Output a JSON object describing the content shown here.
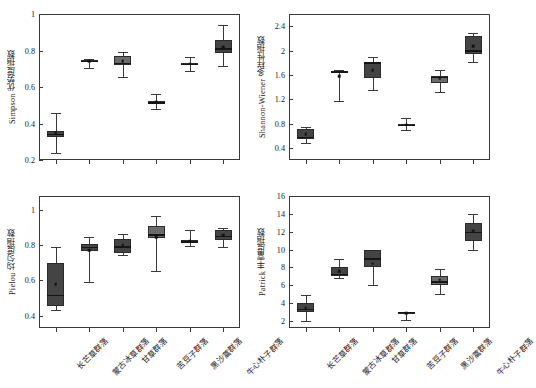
{
  "figure": {
    "categories": [
      "长芒草群落",
      "蒙古冰草群落",
      "甘草群落",
      "苦豆子群落",
      "黑沙蒿群落",
      "牛心朴子群落"
    ],
    "panels": [
      {
        "id": "simpson",
        "ylabel": "Simpson 优势度指数",
        "ylim": [
          0.2,
          1.0
        ],
        "yticks": [
          0.2,
          0.4,
          0.6,
          0.8,
          1.0
        ],
        "yticklabels": [
          "0.2",
          "0.4",
          "0.6",
          "0.8",
          "1.0"
        ]
      },
      {
        "id": "shannon",
        "ylabel": "Shannon-Wiener 多样性指数",
        "ylim": [
          0.2,
          2.6
        ],
        "yticks": [
          0.4,
          0.8,
          1.2,
          1.6,
          2.0,
          2.4
        ],
        "yticklabels": [
          "0.4",
          "0.8",
          "1.2",
          "1.6",
          "2.0",
          "2.4"
        ]
      },
      {
        "id": "pielou",
        "ylabel": "Pielou 均匀度指数",
        "ylim": [
          0.33,
          1.08
        ],
        "yticks": [
          0.4,
          0.6,
          0.8,
          1.0
        ],
        "yticklabels": [
          "0.4",
          "0.6",
          "0.8",
          "1.0"
        ]
      },
      {
        "id": "patrick",
        "ylabel": "Patrick 丰富度指数",
        "ylim": [
          1.2,
          16.0
        ],
        "yticks": [
          2,
          4,
          6,
          8,
          10,
          12,
          14,
          16
        ],
        "yticklabels": [
          "2",
          "4",
          "6",
          "8",
          "10",
          "12",
          "14",
          "16"
        ]
      }
    ]
  },
  "chart_data": [
    {
      "type": "box",
      "id": "simpson",
      "title": "",
      "xlabel": "",
      "ylabel": "Simpson 优势度指数",
      "ylim": [
        0.2,
        1.0
      ],
      "yticks": [
        0.2,
        0.4,
        0.6,
        0.8,
        1.0
      ],
      "grid": false,
      "legend": "none",
      "categories": [
        "长芒草群落",
        "蒙古冰草群落",
        "甘草群落",
        "苦豆子群落",
        "黑沙蒿群落",
        "牛心朴子群落"
      ],
      "boxes": [
        {
          "category": "长芒草群落",
          "min": 0.24,
          "q1": 0.325,
          "median": 0.345,
          "q3": 0.357,
          "max": 0.455,
          "mean": 0.347,
          "shade": "dark"
        },
        {
          "category": "蒙古冰草群落",
          "min": 0.705,
          "q1": 0.738,
          "median": 0.742,
          "q3": 0.746,
          "max": 0.753,
          "mean": 0.74,
          "shade": "dark"
        },
        {
          "category": "甘草群落",
          "min": 0.655,
          "q1": 0.718,
          "median": 0.731,
          "q3": 0.772,
          "max": 0.793,
          "mean": 0.741,
          "shade": "mid"
        },
        {
          "category": "苦豆子群落",
          "min": 0.477,
          "q1": 0.508,
          "median": 0.516,
          "q3": 0.522,
          "max": 0.562,
          "mean": 0.517,
          "shade": "dark"
        },
        {
          "category": "黑沙蒿群落",
          "min": 0.688,
          "q1": 0.723,
          "median": 0.728,
          "q3": 0.731,
          "max": 0.762,
          "mean": 0.727,
          "shade": "dark"
        },
        {
          "category": "牛心朴子群落",
          "min": 0.714,
          "q1": 0.787,
          "median": 0.811,
          "q3": 0.856,
          "max": 0.941,
          "mean": 0.817,
          "shade": "dark"
        }
      ]
    },
    {
      "type": "box",
      "id": "shannon",
      "title": "",
      "xlabel": "",
      "ylabel": "Shannon-Wiener 多样性指数",
      "ylim": [
        0.2,
        2.6
      ],
      "yticks": [
        0.4,
        0.8,
        1.2,
        1.6,
        2.0,
        2.4
      ],
      "grid": false,
      "legend": "none",
      "categories": [
        "长芒草群落",
        "蒙古冰草群落",
        "甘草群落",
        "苦豆子群落",
        "黑沙蒿群落",
        "牛心朴子群落"
      ],
      "boxes": [
        {
          "category": "长芒草群落",
          "min": 0.475,
          "q1": 0.545,
          "median": 0.585,
          "q3": 0.705,
          "max": 0.735,
          "mean": 0.627,
          "shade": "dark"
        },
        {
          "category": "蒙古冰草群落",
          "min": 1.165,
          "q1": 1.635,
          "median": 1.655,
          "q3": 1.665,
          "max": 1.675,
          "mean": 1.575,
          "shade": "dark"
        },
        {
          "category": "甘草群落",
          "min": 1.345,
          "q1": 1.545,
          "median": 1.805,
          "q3": 1.815,
          "max": 1.895,
          "mean": 1.675,
          "shade": "dark"
        },
        {
          "category": "苦豆子群落",
          "min": 0.685,
          "q1": 0.755,
          "median": 0.775,
          "q3": 0.785,
          "max": 0.885,
          "mean": 0.78,
          "shade": "mid"
        },
        {
          "category": "黑沙蒿群落",
          "min": 1.325,
          "q1": 1.465,
          "median": 1.565,
          "q3": 1.585,
          "max": 1.685,
          "mean": 1.54,
          "shade": "mid"
        },
        {
          "category": "牛心朴子群落",
          "min": 1.805,
          "q1": 1.935,
          "median": 2.005,
          "q3": 2.245,
          "max": 2.295,
          "mean": 2.075,
          "shade": "dark"
        }
      ]
    },
    {
      "type": "box",
      "id": "pielou",
      "title": "",
      "xlabel": "",
      "ylabel": "Pielou 均匀度指数",
      "ylim": [
        0.33,
        1.08
      ],
      "yticks": [
        0.4,
        0.6,
        0.8,
        1.0
      ],
      "grid": false,
      "legend": "none",
      "categories": [
        "长芒草群落",
        "蒙古冰草群落",
        "甘草群落",
        "苦豆子群落",
        "黑沙蒿群落",
        "牛心朴子群落"
      ],
      "boxes": [
        {
          "category": "长芒草群落",
          "min": 0.435,
          "q1": 0.455,
          "median": 0.517,
          "q3": 0.7,
          "max": 0.788,
          "mean": 0.578,
          "shade": "dark"
        },
        {
          "category": "蒙古冰草群落",
          "min": 0.592,
          "q1": 0.77,
          "median": 0.792,
          "q3": 0.805,
          "max": 0.845,
          "mean": 0.772,
          "shade": "dark"
        },
        {
          "category": "甘草群落",
          "min": 0.745,
          "q1": 0.755,
          "median": 0.795,
          "q3": 0.835,
          "max": 0.865,
          "mean": 0.8,
          "shade": "dark"
        },
        {
          "category": "苦豆子群落",
          "min": 0.655,
          "q1": 0.84,
          "median": 0.862,
          "q3": 0.912,
          "max": 0.965,
          "mean": 0.845,
          "shade": "mid"
        },
        {
          "category": "黑沙蒿群落",
          "min": 0.795,
          "q1": 0.818,
          "median": 0.823,
          "q3": 0.828,
          "max": 0.885,
          "mean": 0.823,
          "shade": "dark"
        },
        {
          "category": "牛心朴子群落",
          "min": 0.792,
          "q1": 0.828,
          "median": 0.855,
          "q3": 0.888,
          "max": 0.9,
          "mean": 0.857,
          "shade": "dark"
        }
      ]
    },
    {
      "type": "box",
      "id": "patrick",
      "title": "",
      "xlabel": "",
      "ylabel": "Patrick 丰富度指数",
      "ylim": [
        1.2,
        16.0
      ],
      "yticks": [
        2,
        4,
        6,
        8,
        10,
        12,
        14,
        16
      ],
      "grid": false,
      "legend": "none",
      "categories": [
        "长芒草群落",
        "蒙古冰草群落",
        "甘草群落",
        "苦豆子群落",
        "黑沙蒿群落",
        "牛心朴子群落"
      ],
      "boxes": [
        {
          "category": "长芒草群落",
          "min": 2.0,
          "q1": 3.0,
          "median": 3.35,
          "q3": 4.0,
          "max": 4.9,
          "mean": 3.4,
          "shade": "dark"
        },
        {
          "category": "蒙古冰草群落",
          "min": 6.8,
          "q1": 7.0,
          "median": 7.3,
          "q3": 8.0,
          "max": 8.9,
          "mean": 7.6,
          "shade": "dark"
        },
        {
          "category": "甘草群落",
          "min": 6.0,
          "q1": 8.0,
          "median": 9.0,
          "q3": 10.0,
          "max": 10.0,
          "mean": 8.4,
          "shade": "dark"
        },
        {
          "category": "苦豆子群落",
          "min": 2.05,
          "q1": 2.95,
          "median": 3.0,
          "q3": 3.02,
          "max": 3.05,
          "mean": 2.85,
          "shade": "dark"
        },
        {
          "category": "黑沙蒿群落",
          "min": 5.0,
          "q1": 6.0,
          "median": 6.45,
          "q3": 7.0,
          "max": 7.8,
          "mean": 6.6,
          "shade": "mid"
        },
        {
          "category": "牛心朴子群落",
          "min": 10.0,
          "q1": 11.0,
          "median": 12.0,
          "q3": 13.0,
          "max": 14.0,
          "mean": 12.1,
          "shade": "dark"
        }
      ]
    }
  ],
  "colors": {
    "box_dark": "#444444",
    "box_mid": "#6b6b6b",
    "axis": "#3a3a3a",
    "median": "#151515",
    "background": "#ffffff"
  }
}
